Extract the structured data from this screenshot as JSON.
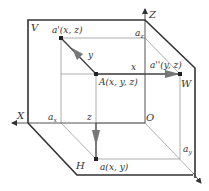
{
  "diagram": {
    "planes": {
      "V": "V",
      "W": "W",
      "H": "H"
    },
    "axes": {
      "X": "X",
      "Z": "Z",
      "origin": "O"
    },
    "points": {
      "A": "A(x, y, z)",
      "a_front": "a'(x, z)",
      "a_side": "a''(y, z)",
      "a_top": "a(x, y)"
    },
    "axis_marks": {
      "ax": "a",
      "ax_sub": "x",
      "ay": "a",
      "ay_sub": "y",
      "az": "a",
      "az_sub": "z"
    },
    "distances": {
      "x": "x",
      "y": "y",
      "z": "z"
    },
    "colors": {
      "frame": "#333333",
      "thin_line": "#9a9a9a",
      "arrow": "#777777",
      "point": "#222222"
    }
  }
}
